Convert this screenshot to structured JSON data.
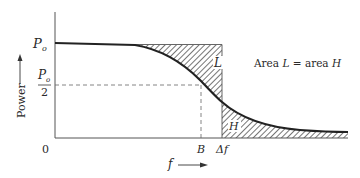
{
  "diagram": {
    "y_axis": {
      "label": "Power",
      "ticks": {
        "po": "P",
        "po_sub": "o",
        "po_half_num": "P",
        "po_half_sub": "o",
        "po_half_den": "2"
      }
    },
    "x_axis": {
      "label": "f",
      "origin": "0",
      "tick_b": "B",
      "tick_delta_f": "Δf"
    },
    "regions": {
      "upper": "L",
      "lower": "H"
    },
    "annotation": {
      "prefix": "Area ",
      "l": "L",
      "middle": " = area ",
      "h": "H"
    },
    "colors": {
      "ink": "#2a2a2a",
      "background": "#ffffff"
    }
  }
}
